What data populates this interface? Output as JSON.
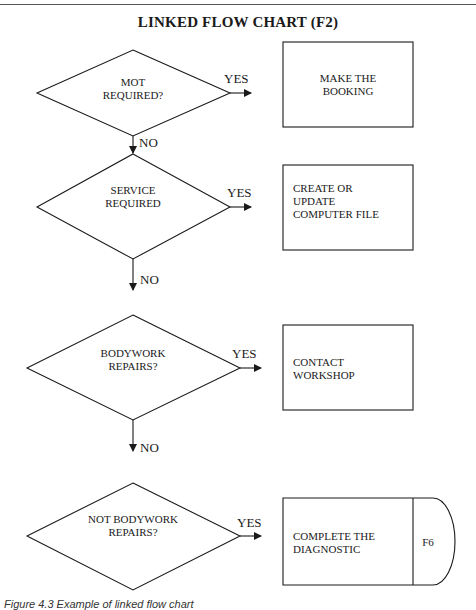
{
  "title": "LINKED FLOW CHART (F2)",
  "decisions": [
    {
      "label": "MOT\nREQUIRED?",
      "yes": "YES",
      "no": "NO"
    },
    {
      "label": "SERVICE\nREQUIRED",
      "yes": "YES",
      "no": "NO"
    },
    {
      "label": "BODYWORK\nREPAIRS?",
      "yes": "YES",
      "no": "NO"
    },
    {
      "label": "NOT BODYWORK\nREPAIRS?",
      "yes": "YES"
    }
  ],
  "actions": [
    {
      "label": "MAKE THE\nBOOKING"
    },
    {
      "label": "CREATE OR\nUPDATE\nCOMPUTER FILE"
    },
    {
      "label": "CONTACT\nWORKSHOP"
    },
    {
      "label": "COMPLETE THE\nDIAGNOSTIC",
      "connector": "F6"
    }
  ],
  "caption": "Figure 4.3  Example of linked flow chart",
  "colors": {
    "stroke": "#1a1a1a",
    "background": "#ffffff"
  }
}
